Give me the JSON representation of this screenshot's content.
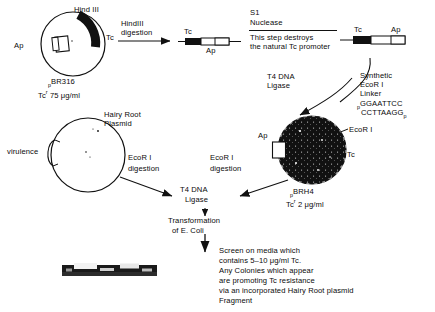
{
  "diagram": {
    "type": "molecular-cloning-flow"
  },
  "plasmid_pbr316": {
    "site_label": "Hind III",
    "tc_label": "Tc",
    "ap_label": "Ap",
    "name_sub": "p",
    "name": "BR316",
    "marker_prefix": "Tc",
    "marker_sup": "r",
    "marker_value": " 75 μg/ml"
  },
  "step_hindiii": {
    "line1": "HindIII",
    "line2": "digestion"
  },
  "fragment1": {
    "tc_label": "Tc",
    "ap_label": "Ap"
  },
  "step_s1": {
    "line1": "S1",
    "line2": "Nuclease",
    "note1": "This step destroys",
    "note2": "the natural Tc promoter"
  },
  "fragment2": {
    "tc_label": "Tc",
    "ap_label": "Ap"
  },
  "step_ligase_top": {
    "line1": "T4 DNA",
    "line2": "Ligase"
  },
  "linker": {
    "line1": "Synthetic",
    "line2": "EcoR I",
    "line3": "Linker",
    "seq_top_sub": "p",
    "seq_top": "GGAATTCC",
    "seq_bottom": "CCTTAAGG",
    "seq_bottom_sub": "p"
  },
  "plasmid_pbrh4": {
    "ecori_label": "EcoR I",
    "tc_label": "Tc",
    "ap_label": "Ap",
    "name_sub": "p",
    "name": "BRH4",
    "marker_prefix": "Tc",
    "marker_sup": "r",
    "marker_value": " 2 μg/ml"
  },
  "plasmid_hairyroot": {
    "title_line1": "Hairy Root",
    "title_line2": "Plasmid",
    "virulence_label": "virulence"
  },
  "step_ecori_left": {
    "line1": "EcoR I",
    "line2": "digestion"
  },
  "step_ecori_right": {
    "line1": "EcoR I",
    "line2": "digestion"
  },
  "step_ligase_bottom": {
    "line1": "T4 DNA",
    "line2": "Ligase"
  },
  "step_transformation": {
    "line1": "Transformation",
    "line2": "of E. Coli"
  },
  "screen_note": {
    "line1": "Screen on media which",
    "line2": "contains 5–10 μg/ml Tc.",
    "line3": "Any Colonies which appear",
    "line4": "are promoting Tc resistance",
    "line5": "via an incorporated Hairy Root plasmid",
    "line6": "Fragment"
  },
  "gel": {
    "name": "colony-plate-photo"
  },
  "colors": {
    "ink": "#111111",
    "paper": "#ffffff"
  }
}
